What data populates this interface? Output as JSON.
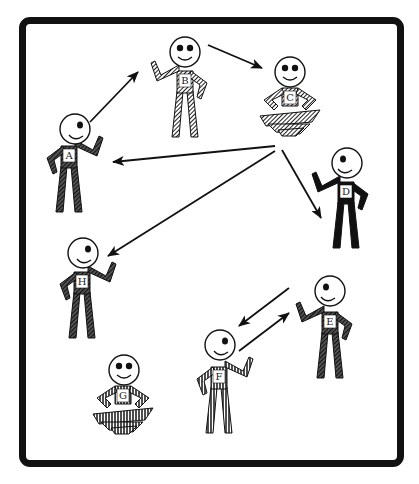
{
  "diagram": {
    "type": "communication-network",
    "frame": {
      "border_color": "#111111",
      "background": "#ffffff"
    },
    "people": [
      {
        "id": "A",
        "label": "A",
        "pose": "standing-waving",
        "fill": "dark-diagonal",
        "x": 70,
        "y": 150
      },
      {
        "id": "B",
        "label": "B",
        "pose": "standing-waving",
        "fill": "diagonal-hatch",
        "x": 185,
        "y": 75
      },
      {
        "id": "C",
        "label": "C",
        "pose": "sitting-crosslegged",
        "fill": "diagonal-hatch",
        "x": 290,
        "y": 95
      },
      {
        "id": "D",
        "label": "D",
        "pose": "standing-waving",
        "fill": "solid-black",
        "x": 345,
        "y": 190
      },
      {
        "id": "E",
        "label": "E",
        "pose": "standing-waving",
        "fill": "dark-diagonal",
        "x": 330,
        "y": 320
      },
      {
        "id": "F",
        "label": "F",
        "pose": "standing-waving",
        "fill": "vertical-stripes",
        "x": 218,
        "y": 380
      },
      {
        "id": "G",
        "label": "G",
        "pose": "sitting-crosslegged",
        "fill": "vertical-stripes",
        "x": 123,
        "y": 400
      },
      {
        "id": "H",
        "label": "H",
        "pose": "standing-waving",
        "fill": "dark-diagonal",
        "x": 83,
        "y": 285
      }
    ],
    "arrows": [
      {
        "from": "A",
        "to": "B"
      },
      {
        "from": "B",
        "to": "C"
      },
      {
        "from": "C",
        "to": "A"
      },
      {
        "from": "C",
        "to": "H"
      },
      {
        "from": "C",
        "to": "D"
      },
      {
        "from": "E",
        "to": "F"
      },
      {
        "from": "F",
        "to": "E"
      }
    ]
  }
}
